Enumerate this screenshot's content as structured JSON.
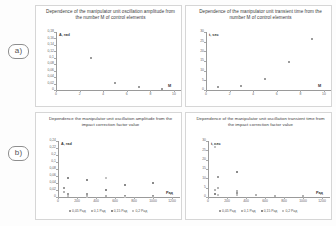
{
  "figure": {
    "row_labels": [
      {
        "id": "a",
        "text": "a)"
      },
      {
        "id": "b",
        "text": "b)"
      }
    ]
  },
  "chart_data": [
    {
      "id": "top-left",
      "type": "scatter",
      "title": "Dependence of the manipulator unit oscillation amplitude from the number M of control elements",
      "xlabel": "M",
      "ylabel": "A, rad",
      "xlim": [
        0,
        10
      ],
      "ylim": [
        0,
        0.18
      ],
      "xticks": [
        "0",
        "2",
        "4",
        "6",
        "8",
        "10"
      ],
      "yticks": [
        "0,18",
        "0,16",
        "0,14",
        "0,12",
        "0,1",
        "0,08",
        "0,06",
        "0,04",
        "0,02",
        "0"
      ],
      "grid": false,
      "legend": "none",
      "series": [
        {
          "name": "amplitude",
          "x": [
            1,
            3,
            5,
            7,
            9
          ],
          "y": [
            0.17,
            0.1,
            0.022,
            0.008,
            0.004
          ]
        }
      ]
    },
    {
      "id": "top-right",
      "type": "scatter",
      "title": "Dependence of the manipulator unit transient time from the number M of control elements",
      "xlabel": "M",
      "ylabel": "t, sec",
      "xlim": [
        0,
        10
      ],
      "ylim": [
        0,
        30
      ],
      "xticks": [
        "0",
        "2",
        "4",
        "6",
        "8",
        "10"
      ],
      "yticks": [
        "30",
        "25",
        "20",
        "15",
        "10",
        "5",
        "0"
      ],
      "grid": false,
      "legend": "none",
      "series": [
        {
          "name": "transient time",
          "x": [
            1,
            3,
            5,
            7,
            9
          ],
          "y": [
            1.5,
            2.0,
            5.5,
            14.5,
            26.5
          ]
        }
      ]
    },
    {
      "id": "bottom-left",
      "type": "scatter",
      "title": "Dependence the manipulator unit oscillation amplitude from the impact correction factor value",
      "xlabel": "Рад",
      "ylabel": "A, rad",
      "xlim": [
        0,
        1200
      ],
      "ylim": [
        0,
        0.24
      ],
      "xticks": [
        "0",
        "200",
        "400",
        "600",
        "800",
        "1000",
        "1200"
      ],
      "yticks": [
        "0,24",
        "0,22",
        "0,2",
        "0,1",
        "0,08",
        "0,06",
        "0,04",
        "0,02",
        "0"
      ],
      "grid": false,
      "legend": "bottom",
      "series": [
        {
          "name": "0,05 Рад",
          "x": [
            60,
            100,
            300,
            500,
            700,
            1000
          ],
          "y": [
            0.04,
            0.012,
            0.012,
            0.006,
            0.004,
            0.003
          ]
        },
        {
          "name": "0,1 Рад",
          "x": [
            60,
            100,
            300,
            500,
            700,
            1000
          ],
          "y": [
            0.022,
            0.004,
            0.004,
            0.003,
            0.002,
            0.002
          ]
        },
        {
          "name": "0,15 Рад",
          "x": [
            100,
            300,
            500,
            700,
            1000
          ],
          "y": [
            0.083,
            0.072,
            0.032,
            0.052,
            0.062
          ]
        },
        {
          "name": "0,2 Рад",
          "x": [
            100,
            300,
            500,
            700
          ],
          "y": [
            0.005,
            0.002,
            0.083,
            0.002
          ]
        }
      ]
    },
    {
      "id": "bottom-right",
      "type": "scatter",
      "title": "Dependence of the manipulator unit oscillation transient time from the impact correction factor value",
      "xlabel": "Рад",
      "ylabel": "t, sec",
      "xlim": [
        0,
        1200
      ],
      "ylim": [
        0,
        30
      ],
      "xticks": [
        "0",
        "200",
        "400",
        "600",
        "800",
        "1000",
        "1200"
      ],
      "yticks": [
        "30",
        "25",
        "20",
        "15",
        "10",
        "5",
        "0"
      ],
      "grid": false,
      "legend": "bottom",
      "series": [
        {
          "name": "0,05 Рад",
          "x": [
            70,
            110,
            300,
            500,
            700,
            1000
          ],
          "y": [
            28.5,
            10.5,
            2.0,
            1.0,
            0.8,
            0.8
          ]
        },
        {
          "name": "0,1 Рад",
          "x": [
            70,
            110,
            300,
            500,
            700,
            1000
          ],
          "y": [
            4.0,
            5.0,
            3.0,
            1.0,
            0.8,
            0.8
          ]
        },
        {
          "name": "0,15 Рад",
          "x": [
            70,
            110,
            300
          ],
          "y": [
            1.5,
            1.0,
            13.5
          ]
        },
        {
          "name": "0,2 Рад",
          "x": [
            70,
            110,
            300
          ],
          "y": [
            27.0,
            1.0,
            1.0
          ]
        }
      ]
    }
  ]
}
